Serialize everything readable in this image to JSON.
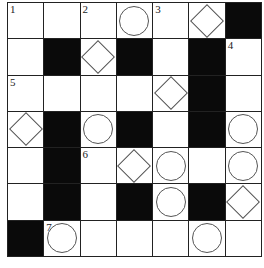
{
  "puzzle": {
    "rows": 7,
    "cols": 7,
    "colors": {
      "block": "#0a0a0a",
      "line": "#222222",
      "cell": "#ffffff"
    },
    "grid": [
      [
        {
          "t": "w",
          "n": "1"
        },
        {
          "t": "w"
        },
        {
          "t": "w",
          "n": "2"
        },
        {
          "t": "w",
          "m": "circle"
        },
        {
          "t": "w",
          "n": "3"
        },
        {
          "t": "w",
          "m": "diamond"
        },
        {
          "t": "b"
        }
      ],
      [
        {
          "t": "w"
        },
        {
          "t": "b"
        },
        {
          "t": "w",
          "m": "diamond"
        },
        {
          "t": "b"
        },
        {
          "t": "w"
        },
        {
          "t": "b"
        },
        {
          "t": "w",
          "n": "4"
        }
      ],
      [
        {
          "t": "w",
          "n": "5"
        },
        {
          "t": "w"
        },
        {
          "t": "w"
        },
        {
          "t": "w"
        },
        {
          "t": "w",
          "m": "diamond"
        },
        {
          "t": "b"
        },
        {
          "t": "w"
        }
      ],
      [
        {
          "t": "w",
          "m": "diamond"
        },
        {
          "t": "b"
        },
        {
          "t": "w",
          "m": "circle"
        },
        {
          "t": "b"
        },
        {
          "t": "w"
        },
        {
          "t": "b"
        },
        {
          "t": "w",
          "m": "circle"
        }
      ],
      [
        {
          "t": "w"
        },
        {
          "t": "b"
        },
        {
          "t": "w",
          "n": "6"
        },
        {
          "t": "w",
          "m": "diamond"
        },
        {
          "t": "w",
          "m": "circle"
        },
        {
          "t": "w"
        },
        {
          "t": "w",
          "m": "circle"
        }
      ],
      [
        {
          "t": "w"
        },
        {
          "t": "b"
        },
        {
          "t": "w"
        },
        {
          "t": "b"
        },
        {
          "t": "w",
          "m": "circle"
        },
        {
          "t": "b"
        },
        {
          "t": "w",
          "m": "diamond"
        }
      ],
      [
        {
          "t": "b"
        },
        {
          "t": "w",
          "n": "7",
          "m": "circle"
        },
        {
          "t": "w"
        },
        {
          "t": "w"
        },
        {
          "t": "w"
        },
        {
          "t": "w",
          "m": "circle"
        },
        {
          "t": "w"
        }
      ]
    ]
  }
}
